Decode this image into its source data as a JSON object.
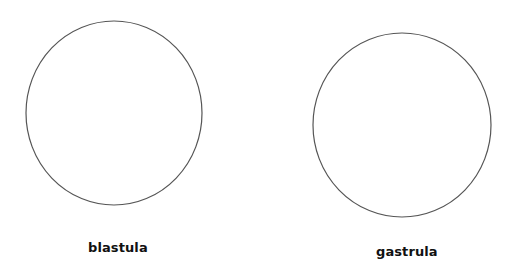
{
  "diagram": {
    "background": "#ffffff",
    "stroke_color": "#555555",
    "label_color": "#111111",
    "stages": [
      {
        "name": "blastula",
        "label": "blastula",
        "shape": "ellipse",
        "cx": 114,
        "cy": 113,
        "rx": 88,
        "ry": 92
      },
      {
        "name": "gastrula",
        "label": "gastrula",
        "shape": "ellipse",
        "cx": 402,
        "cy": 125,
        "rx": 89,
        "ry": 92
      }
    ]
  }
}
